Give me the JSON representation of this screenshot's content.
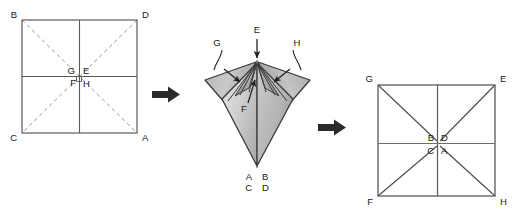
{
  "diagram": {
    "background_color": "#ffffff",
    "line_color": "#555555",
    "dash_color": "#8a8a8a",
    "label_color": "#1a1a1a",
    "arrow_color": "#2b2b2b",
    "fold_fill_light": "#d8d8d8",
    "fold_fill_mid": "#b9b9b9",
    "fold_fill_dark": "#9a9a9a"
  },
  "panels": [
    {
      "id": "panel-1",
      "name": "unfolded-square-before",
      "kind": "square",
      "diagonal_style": "dashed",
      "corner_labels": {
        "top_left": "B",
        "top_right": "D",
        "bottom_left": "C",
        "bottom_right": "A"
      },
      "center_labels": {
        "top_left": "G",
        "top_right": "E",
        "bottom_left": "F",
        "bottom_right": "H"
      }
    },
    {
      "id": "panel-2",
      "name": "folded-3d-shape",
      "kind": "folded",
      "apex_label": "E",
      "left_flap_label": "G",
      "right_flap_label": "H",
      "inner_label": "F",
      "bottom_labels_row1": "A B",
      "bottom_labels_row2": "C D",
      "bottom_label_a": "A",
      "bottom_label_b": "B",
      "bottom_label_c": "C",
      "bottom_label_d": "D"
    },
    {
      "id": "panel-3",
      "name": "unfolded-square-after",
      "kind": "square",
      "diagonal_style": "solid",
      "corner_labels": {
        "top_left": "G",
        "top_right": "E",
        "bottom_left": "F",
        "bottom_right": "H"
      },
      "center_labels": {
        "top_left": "B",
        "top_right": "D",
        "bottom_left": "C",
        "bottom_right": "A"
      }
    }
  ],
  "arrows": [
    {
      "id": "arrow-1",
      "name": "transition-arrow-1",
      "direction": "right"
    },
    {
      "id": "arrow-2",
      "name": "transition-arrow-2",
      "direction": "right"
    }
  ]
}
